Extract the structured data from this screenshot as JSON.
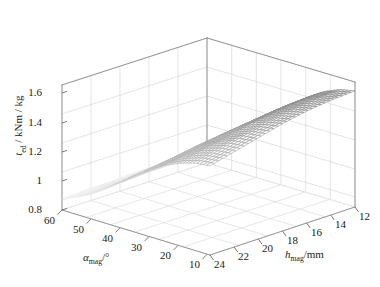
{
  "figure": {
    "kind": "3d-mesh-surface",
    "background": "#ffffff",
    "line_color": "#9a9a9a",
    "grid_color": "#d8d8d8",
    "mesh_color": "#707070"
  },
  "axes": {
    "z": {
      "label_prefix": "t",
      "label_sub": "ed",
      "label_suffix": " / kNm / kg",
      "label_full": "t_ed / kNm / kg",
      "ticks": [
        "0.8",
        "1",
        "1.2",
        "1.4",
        "1.6"
      ],
      "min": 0.8,
      "max": 1.6
    },
    "x": {
      "label_prefix": "α",
      "label_sub": "mag",
      "label_suffix": "/°",
      "label_full": "α_mag/°",
      "ticks": [
        "60",
        "50",
        "40",
        "30",
        "20",
        "10"
      ],
      "min": 10,
      "max": 60,
      "direction": "descending-left-to-front"
    },
    "y": {
      "label_prefix": "h",
      "label_sub": "mag",
      "label_suffix": "/mm",
      "label_full": "h_mag/mm",
      "ticks": [
        "24",
        "22",
        "20",
        "18",
        "16",
        "14",
        "12"
      ],
      "min": 12,
      "max": 24,
      "direction": "descending-front-to-right"
    }
  },
  "chart_data": {
    "type": "surface",
    "title": "",
    "xlabel": "α_mag/°",
    "ylabel": "h_mag/mm",
    "zlabel": "t_ed / kNm / kg",
    "xlim": [
      10,
      60
    ],
    "ylim": [
      12,
      24
    ],
    "zlim": [
      0.8,
      1.6
    ],
    "xticks": [
      10,
      20,
      30,
      40,
      50,
      60
    ],
    "yticks": [
      12,
      14,
      16,
      18,
      20,
      22,
      24
    ],
    "zticks": [
      0.8,
      1.0,
      1.2,
      1.4,
      1.6
    ],
    "grid": true,
    "legend": "none",
    "x": [
      10,
      15,
      20,
      25,
      30,
      35,
      40,
      45,
      50,
      55,
      60
    ],
    "y": [
      12,
      14,
      16,
      18,
      20,
      22,
      24
    ],
    "z": [
      [
        1.55,
        1.53,
        1.49,
        1.43,
        1.36,
        1.27,
        1.18,
        1.09,
        1.01,
        0.95,
        0.9
      ],
      [
        1.54,
        1.52,
        1.48,
        1.42,
        1.35,
        1.26,
        1.17,
        1.08,
        1.0,
        0.94,
        0.9
      ],
      [
        1.52,
        1.5,
        1.46,
        1.4,
        1.33,
        1.25,
        1.16,
        1.07,
        1.0,
        0.94,
        0.89
      ],
      [
        1.49,
        1.47,
        1.44,
        1.38,
        1.31,
        1.23,
        1.14,
        1.06,
        0.99,
        0.93,
        0.89
      ],
      [
        1.45,
        1.44,
        1.4,
        1.35,
        1.29,
        1.21,
        1.13,
        1.05,
        0.98,
        0.93,
        0.88
      ],
      [
        1.41,
        1.4,
        1.37,
        1.32,
        1.26,
        1.19,
        1.11,
        1.04,
        0.97,
        0.92,
        0.88
      ],
      [
        1.37,
        1.36,
        1.33,
        1.29,
        1.23,
        1.17,
        1.1,
        1.03,
        0.96,
        0.91,
        0.87
      ]
    ],
    "z_note": "rows correspond to y (h_mag 12..24), columns to x (alpha_mag 10..60)",
    "max_value": 1.55,
    "min_value": 0.87
  }
}
